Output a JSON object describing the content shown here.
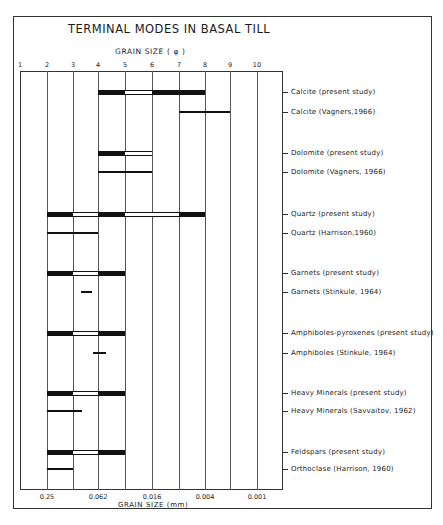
{
  "chart_data": {
    "type": "range-bar",
    "title": "TERMINAL MODES IN BASAL TILL",
    "top_axis_label": "GRAIN SIZE ( φ )",
    "xlabel": "GRAIN SIZE (mm)",
    "phi_ticks": [
      "1",
      "2",
      "3",
      "4",
      "5",
      "6",
      "7",
      "8",
      "9",
      "10"
    ],
    "mm_ticks": [
      {
        "phi": 2,
        "label": "0.25"
      },
      {
        "phi": 4,
        "label": "0.062"
      },
      {
        "phi": 6,
        "label": "0.016"
      },
      {
        "phi": 8,
        "label": "0.004"
      },
      {
        "phi": 10,
        "label": "0.001"
      }
    ],
    "xlim": [
      1,
      11
    ],
    "grid": true,
    "legend": "bars: black = terminal mode, white = intermediate range; thin line = comparative study range",
    "rows": [
      {
        "label": "Calcite (present study)",
        "style": "bar",
        "segments": [
          {
            "from": 4,
            "to": 5,
            "fill": "black"
          },
          {
            "from": 5,
            "to": 6,
            "fill": "white"
          },
          {
            "from": 6,
            "to": 8,
            "fill": "black"
          }
        ]
      },
      {
        "label": "Calcite (Vagners,1966)",
        "style": "line",
        "segments": [
          {
            "from": 7,
            "to": 9
          }
        ]
      },
      {
        "label": "Dolomite (present study)",
        "style": "bar",
        "segments": [
          {
            "from": 4,
            "to": 5,
            "fill": "black"
          },
          {
            "from": 5,
            "to": 6,
            "fill": "white"
          }
        ]
      },
      {
        "label": "Dolomite (Vagners, 1966)",
        "style": "line",
        "segments": [
          {
            "from": 4,
            "to": 6
          }
        ]
      },
      {
        "label": "Quartz (present study)",
        "style": "bar",
        "segments": [
          {
            "from": 2,
            "to": 3,
            "fill": "black"
          },
          {
            "from": 3,
            "to": 4,
            "fill": "white"
          },
          {
            "from": 4,
            "to": 5,
            "fill": "black"
          },
          {
            "from": 5,
            "to": 7,
            "fill": "white"
          },
          {
            "from": 7,
            "to": 8,
            "fill": "black"
          }
        ]
      },
      {
        "label": "Quartz (Harrison,1960)",
        "style": "line",
        "segments": [
          {
            "from": 2,
            "to": 4
          }
        ]
      },
      {
        "label": "Garnets (present study)",
        "style": "bar",
        "segments": [
          {
            "from": 2,
            "to": 3,
            "fill": "black"
          },
          {
            "from": 3,
            "to": 4,
            "fill": "white"
          },
          {
            "from": 4,
            "to": 5,
            "fill": "black"
          }
        ]
      },
      {
        "label": "Garnets (Stinkule, 1964)",
        "style": "line",
        "segments": [
          {
            "from": 3.3,
            "to": 3.75
          }
        ]
      },
      {
        "label": "Amphiboles-pyroxenes (present study)",
        "style": "bar",
        "segments": [
          {
            "from": 2,
            "to": 3,
            "fill": "black"
          },
          {
            "from": 3,
            "to": 4,
            "fill": "white"
          },
          {
            "from": 4,
            "to": 5,
            "fill": "black"
          }
        ]
      },
      {
        "label": "Amphiboles (Stinkule, 1964)",
        "style": "line",
        "segments": [
          {
            "from": 3.8,
            "to": 4.3
          }
        ]
      },
      {
        "label": "Heavy Minerals (present study)",
        "style": "bar",
        "segments": [
          {
            "from": 2,
            "to": 3,
            "fill": "black"
          },
          {
            "from": 3,
            "to": 4,
            "fill": "white"
          },
          {
            "from": 4,
            "to": 5,
            "fill": "black"
          }
        ]
      },
      {
        "label": "Heavy Minerals (Savvaitov, 1962)",
        "style": "line",
        "segments": [
          {
            "from": 2,
            "to": 3.35
          }
        ]
      },
      {
        "label": "Feldspars (present study)",
        "style": "bar",
        "segments": [
          {
            "from": 2,
            "to": 3,
            "fill": "black"
          },
          {
            "from": 3,
            "to": 4,
            "fill": "white"
          },
          {
            "from": 4,
            "to": 5,
            "fill": "black"
          }
        ]
      },
      {
        "label": "Orthoclase (Harrison, 1960)",
        "style": "line",
        "segments": [
          {
            "from": 2,
            "to": 3
          }
        ]
      }
    ]
  },
  "layout": {
    "phi_x": [
      20,
      47,
      73,
      98,
      125,
      152,
      179,
      205,
      230,
      257,
      283
    ],
    "row_y": [
      92,
      112,
      153,
      172,
      214,
      233,
      273,
      292,
      333,
      353,
      393,
      411,
      452,
      469
    ]
  }
}
